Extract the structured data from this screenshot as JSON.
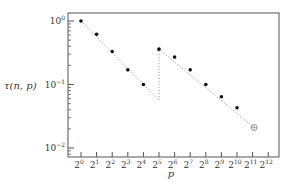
{
  "chart_data": {
    "type": "scatter",
    "title": "",
    "xlabel": "p",
    "ylabel": "τ(n, p)",
    "xscale": "log2",
    "yscale": "log10",
    "xlim": [
      0,
      12
    ],
    "ylim": [
      -2,
      0
    ],
    "x_tick_labels": [
      "2^0",
      "2^1",
      "2^2",
      "2^3",
      "2^4",
      "2^5",
      "2^6",
      "2^7",
      "2^8",
      "2^9",
      "2^10",
      "2^11",
      "2^12"
    ],
    "y_tick_labels": [
      "10^0",
      "10^-1",
      "10^-2"
    ],
    "grid": false,
    "legend": null,
    "series": [
      {
        "name": "segment-1",
        "marker": "filled-dot",
        "line": "dotted",
        "x": [
          1,
          2,
          4,
          8,
          16
        ],
        "values": [
          1.0,
          0.62,
          0.33,
          0.17,
          0.1
        ],
        "trend_end": {
          "x": 32,
          "value": 0.057
        }
      },
      {
        "name": "segment-2",
        "marker": "filled-dot",
        "line": "dotted",
        "x": [
          32,
          64,
          128,
          256,
          512,
          1024
        ],
        "values": [
          0.36,
          0.27,
          0.17,
          0.1,
          0.064,
          0.043
        ],
        "trend_end": {
          "x": 2200,
          "value": 0.021
        }
      },
      {
        "name": "endpoint",
        "marker": "hollow-crossed-circle",
        "x": [
          2200
        ],
        "values": [
          0.021
        ]
      }
    ],
    "annotations": [
      "vertical dotted jump at p = 2^5 from ~0.057 to ~0.36"
    ]
  },
  "labels": {
    "ylabel_text": "τ(n, p)",
    "xlabel_text": "p"
  },
  "colors": {
    "axis": "#555555",
    "marker": "#111111",
    "dotted_line": "#9a9a9a",
    "hollow_marker": "#888888"
  }
}
